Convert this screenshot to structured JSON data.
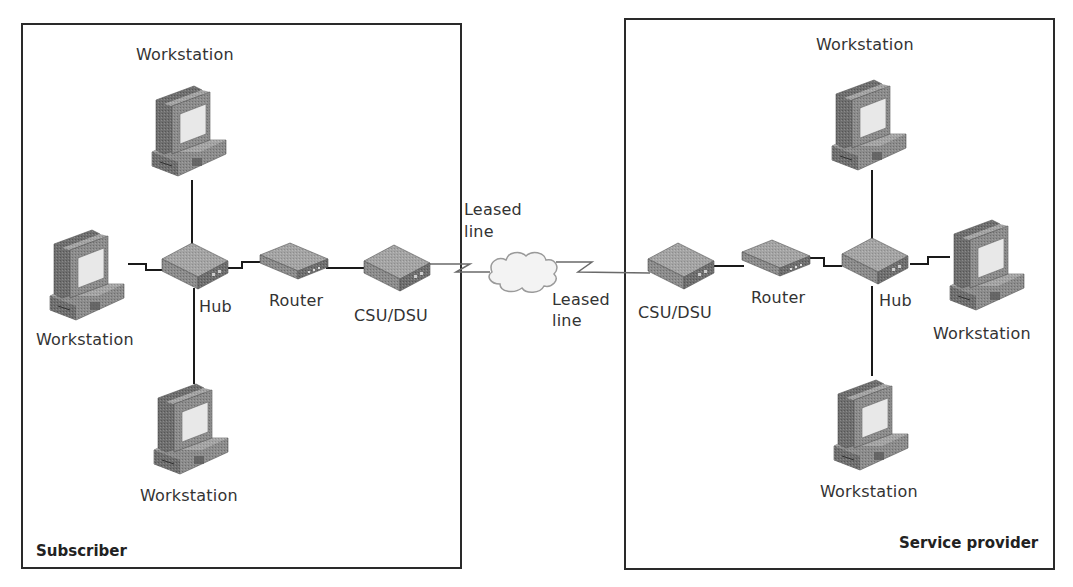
{
  "zones": [
    {
      "id": "subscriber",
      "label": "Subscriber"
    },
    {
      "id": "service-provider",
      "label": "Service provider"
    }
  ],
  "subscriber": {
    "workstation_top": "Workstation",
    "workstation_left": "Workstation",
    "workstation_bottom": "Workstation",
    "hub": "Hub",
    "router": "Router",
    "csu_dsu": "CSU/DSU",
    "leased_line": [
      "Leased",
      "line"
    ]
  },
  "provider": {
    "workstation_top": "Workstation",
    "workstation_right": "Workstation",
    "workstation_bottom": "Workstation",
    "hub": "Hub",
    "router": "Router",
    "csu_dsu": "CSU/DSU",
    "leased_line": [
      "Leased",
      "line"
    ]
  },
  "cloud": {
    "name": "wan-cloud"
  },
  "colors": {
    "border": "#2a2a2a",
    "device": "#8a8a8a",
    "screen": "#e6e6e6",
    "cloud": "#f4f4f4"
  }
}
